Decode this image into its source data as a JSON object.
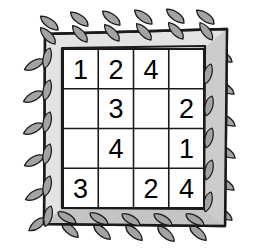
{
  "illustration": {
    "title": "Decorative framed number grid",
    "frame": {
      "name": "laurel-leaf-frame",
      "face_color": "#e3e3e3",
      "shadow_color": "#b4b4b4",
      "outline_color": "#1a1a1a",
      "leaf_color": "#a3a3a3",
      "leaf_outline_color": "#1a1a1a",
      "leaf_count_top": 9,
      "leaf_count_bottom": 9,
      "leaf_count_left": 10,
      "leaf_count_right": 10
    },
    "grid": {
      "name": "number-grid",
      "rows": 4,
      "columns": 4,
      "cell_background": "#ffffff",
      "line_color": "#1a1a1a",
      "cells": [
        [
          "1",
          "2",
          "4",
          ""
        ],
        [
          "",
          "3",
          "",
          "2"
        ],
        [
          "",
          "4",
          "",
          "1"
        ],
        [
          "3",
          "",
          "2",
          "4"
        ]
      ]
    }
  }
}
